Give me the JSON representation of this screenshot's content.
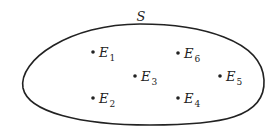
{
  "diagram": {
    "set_label": "S",
    "points": [
      {
        "name": "E",
        "sub": "1",
        "x": 93,
        "y": 52
      },
      {
        "name": "E",
        "sub": "2",
        "x": 93,
        "y": 98
      },
      {
        "name": "E",
        "sub": "3",
        "x": 135,
        "y": 76
      },
      {
        "name": "E",
        "sub": "4",
        "x": 178,
        "y": 98
      },
      {
        "name": "E",
        "sub": "5",
        "x": 220,
        "y": 76
      },
      {
        "name": "E",
        "sub": "6",
        "x": 178,
        "y": 53
      }
    ],
    "colors": {
      "stroke": "#222222",
      "background": "#ffffff"
    }
  }
}
